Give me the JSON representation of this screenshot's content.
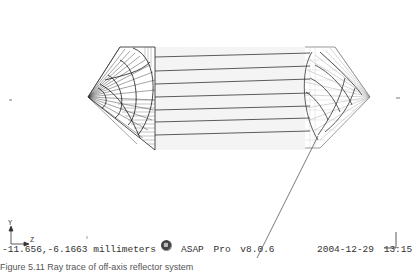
{
  "view": {
    "coordinates": "-11.656,-6.1663",
    "units": "millimeters",
    "app_name": "ASAP",
    "app_edition": "Pro",
    "app_version": "v8.0.6",
    "date": "2004-12-29",
    "time": "13:15",
    "axis_vertical_label": "Y",
    "axis_horizontal_label": "Z"
  },
  "caption": {
    "text": "Figure 5.11 Ray trace of off-axis reflector system"
  },
  "icons": {
    "logo": "asap-logo-icon",
    "axis": "axis-triad-icon",
    "corner": "corner-bracket-icon"
  },
  "colors": {
    "background": "#ffffff",
    "wireframe": "#222222",
    "ray": "#333333",
    "grid_light": "#bbbbbb"
  }
}
